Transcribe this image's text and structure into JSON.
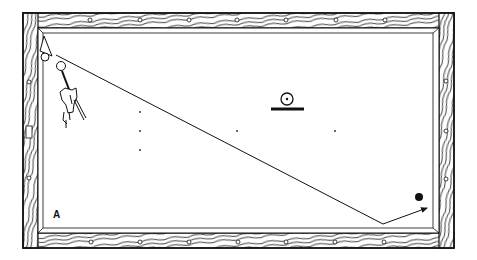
{
  "diagram": {
    "type": "billiards-table-shot-diagram",
    "colors": {
      "ink": "#111111",
      "background": "#ffffff",
      "cloth": "#ffffff",
      "rail_wood": "#ffffff"
    },
    "table": {
      "outer": {
        "x": 23,
        "y": 13,
        "w": 431,
        "h": 235
      },
      "inner": {
        "x": 40,
        "y": 29,
        "w": 398,
        "h": 204
      }
    },
    "rail_diamonds": {
      "top": [
        [
          90,
          20
        ],
        [
          140,
          20
        ],
        [
          189,
          20
        ],
        [
          237,
          20
        ],
        [
          286,
          20
        ],
        [
          336,
          20
        ],
        [
          385,
          20
        ]
      ],
      "bottom": [
        [
          91,
          242
        ],
        [
          140,
          242
        ],
        [
          189,
          242
        ],
        [
          238,
          242
        ],
        [
          286,
          242
        ],
        [
          335,
          242
        ],
        [
          384,
          242
        ]
      ],
      "left": [
        [
          29,
          82
        ],
        [
          29,
          178
        ]
      ],
      "right": [
        [
          446,
          81
        ],
        [
          446,
          131
        ],
        [
          446,
          179
        ]
      ]
    },
    "left_rail_marker": {
      "x": 26,
      "y": 126,
      "w": 6,
      "h": 12
    },
    "table_spots": [
      [
        140,
        112
      ],
      [
        140,
        131
      ],
      [
        237,
        131
      ],
      [
        335,
        131
      ],
      [
        140,
        150
      ]
    ],
    "balls": {
      "corner_ball": {
        "cx": 45,
        "cy": 57,
        "r": 4
      },
      "cue_ball": {
        "cx": 61,
        "cy": 66,
        "r": 4.5
      },
      "object_ball_black": {
        "cx": 419,
        "cy": 197,
        "r": 4
      }
    },
    "rack_triangle": [
      [
        44,
        36
      ],
      [
        40,
        51
      ],
      [
        52,
        56
      ]
    ],
    "shot_path": {
      "points": [
        [
          56,
          55
        ],
        [
          383,
          224
        ],
        [
          427,
          208
        ]
      ],
      "arrow_at_end": true
    },
    "legend_symbol": {
      "circle": {
        "cx": 287,
        "cy": 99,
        "r": 6
      },
      "bar": {
        "x1": 271,
        "x2": 304,
        "y": 109
      }
    },
    "player": {
      "description": "hand holding cue stick near cue ball"
    },
    "corner_label": {
      "text": "A",
      "x": 53,
      "y": 209
    }
  }
}
